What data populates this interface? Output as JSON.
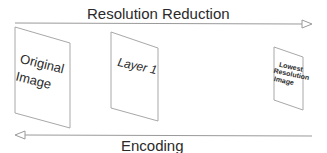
{
  "diagram": {
    "top_arrow": {
      "label": "Resolution Reduction",
      "direction": "right"
    },
    "bottom_arrow": {
      "label": "Encoding",
      "direction": "left"
    },
    "panels": [
      {
        "id": "original",
        "line1": "Original",
        "line2": "Image",
        "line3": ""
      },
      {
        "id": "layer1",
        "line1": "Layer 1",
        "line2": "",
        "line3": ""
      },
      {
        "id": "lowest",
        "line1": "Lowest",
        "line2": "Resolution",
        "line3": "Image"
      }
    ],
    "colors": {
      "line": "#9a9a9a",
      "text": "#2a2a2a",
      "background": "#ffffff"
    }
  }
}
